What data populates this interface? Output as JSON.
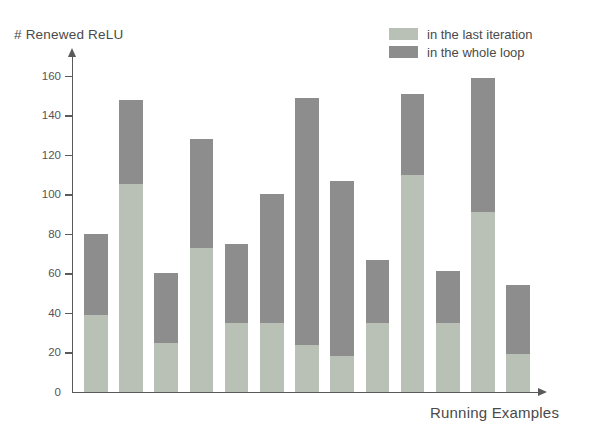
{
  "chart_data": {
    "type": "bar",
    "title": "",
    "subtitle": "",
    "ylabel": "# Renewed ReLU",
    "xlabel": "Running Examples",
    "stacked": true,
    "grid": false,
    "legend_position": "top-right",
    "ylim": [
      0,
      170
    ],
    "yticks": [
      0,
      20,
      40,
      60,
      80,
      100,
      120,
      140,
      160
    ],
    "ytick_labels": [
      "0",
      "20",
      "40",
      "60",
      "80",
      "100",
      "120",
      "140",
      "160"
    ],
    "xticks": [],
    "xtick_labels": [],
    "categories": [
      "1",
      "2",
      "3",
      "4",
      "5",
      "6",
      "7",
      "8",
      "9",
      "10",
      "11",
      "12",
      "13"
    ],
    "series": [
      {
        "name": "in the last iteration",
        "color": "#b9c1b7",
        "values": [
          39,
          105,
          25,
          73,
          35,
          35,
          24,
          18,
          35,
          110,
          35,
          91,
          19
        ]
      },
      {
        "name": "in the whole loop",
        "color": "#8d8d8d",
        "values": [
          41,
          43,
          35,
          55,
          40,
          65,
          125,
          89,
          32,
          41,
          26,
          68,
          35
        ]
      }
    ],
    "totals": [
      80,
      148,
      60,
      128,
      75,
      100,
      149,
      107,
      67,
      151,
      61,
      159,
      54
    ],
    "annotations": []
  },
  "legend": {
    "entries": [
      {
        "label": "in the last iteration",
        "color": "#b9c1b7"
      },
      {
        "label": "in the whole loop",
        "color": "#8d8d8d"
      }
    ]
  },
  "axes": {
    "y_title": "# Renewed ReLU",
    "x_title": "Running Examples"
  },
  "colors": {
    "light_segment": "#b9c1b7",
    "dark_segment": "#8d8d8d",
    "axis": "#5a5a5a",
    "text": "#4a4a4a",
    "background": "#ffffff"
  }
}
